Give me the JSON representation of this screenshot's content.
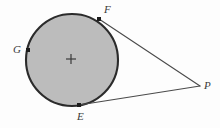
{
  "figure": {
    "kind": "geometry-diagram",
    "width": 220,
    "height": 128,
    "background_color": "#fdfdfd"
  },
  "colors": {
    "background": "#fdfdfd",
    "circle_fill": "#bcbcbc",
    "circle_stroke": "#2b2b2b",
    "line_stroke": "#4a4a4a",
    "point_marker": "#1d1d1d",
    "center_marker": "#3a3a3a",
    "label_text": "#3a3a3a"
  },
  "circle": {
    "name": "circle",
    "center_x": 72,
    "center_y": 60,
    "radius": 46,
    "stroke_width": 2.1,
    "fill": "#bcbcbc"
  },
  "center_marker": {
    "name": "center-cross",
    "x": 71,
    "y": 59,
    "arm": 5,
    "stroke_width": 1.2
  },
  "points": [
    {
      "id": "F",
      "label": "F",
      "x": 99,
      "y": 19,
      "marker_size": 4,
      "label_x": 104,
      "label_y": 4,
      "on_circle": true,
      "tangent_point": true
    },
    {
      "id": "G",
      "label": "G",
      "x": 28,
      "y": 50,
      "marker_size": 4,
      "label_x": 13,
      "label_y": 44,
      "on_circle": true,
      "tangent_point": false
    },
    {
      "id": "E",
      "label": "E",
      "x": 79,
      "y": 105,
      "marker_size": 4,
      "label_x": 77,
      "label_y": 111,
      "on_circle": true,
      "tangent_point": true
    },
    {
      "id": "P",
      "label": "P",
      "x": 200,
      "y": 86,
      "marker_size": 0,
      "label_x": 204,
      "label_y": 80,
      "on_circle": false,
      "tangent_point": false
    }
  ],
  "segments": [
    {
      "id": "FP",
      "name": "tangent-segment-fp",
      "from": "F",
      "to": "P",
      "x1": 99,
      "y1": 19,
      "x2": 200,
      "y2": 86,
      "stroke_width": 1.1
    },
    {
      "id": "EP",
      "name": "tangent-segment-ep",
      "from": "E",
      "to": "P",
      "x1": 79,
      "y1": 105,
      "x2": 200,
      "y2": 86,
      "stroke_width": 1.1
    }
  ]
}
